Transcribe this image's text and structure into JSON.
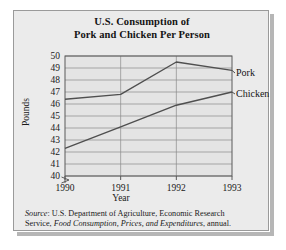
{
  "chart_data": {
    "type": "line",
    "title": "U.S. Consumption of Pork and Chicken Per Person",
    "title_line1": "U.S. Consumption of",
    "title_line2": "Pork and Chicken Per Person",
    "xlabel": "Year",
    "ylabel": "Pounds",
    "x": [
      1990,
      1991,
      1992,
      1993
    ],
    "categories": [
      "1990",
      "1991",
      "1992",
      "1993"
    ],
    "yticks": [
      50,
      49,
      48,
      47,
      46,
      45,
      44,
      43,
      42,
      41,
      40
    ],
    "ylim": [
      40,
      50
    ],
    "y_axis_break": true,
    "grid": true,
    "legend_position": "right-inline",
    "series": [
      {
        "name": "Pork",
        "values": [
          46.4,
          46.8,
          49.5,
          48.8
        ],
        "color": "#4f4f4f"
      },
      {
        "name": "Chicken",
        "values": [
          42.3,
          44.1,
          45.9,
          47.0
        ],
        "color": "#4f4f4f"
      }
    ]
  },
  "source": {
    "label": "Source",
    "line1_rest": ": U.S. Department of Agriculture, Economic Research",
    "line2_a": "Service, ",
    "line2_italic": "Food Consumption, Prices, and Expenditures",
    "line2_b": ", annual."
  }
}
